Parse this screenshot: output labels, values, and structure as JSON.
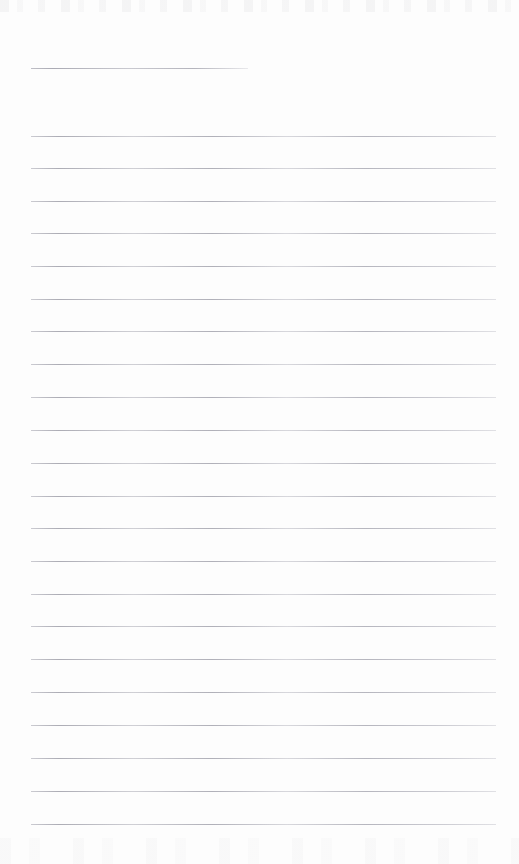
{
  "document": {
    "kind": "ruled-note-page",
    "title_text": "",
    "body_text": "",
    "page_width": 519,
    "page_height": 864,
    "background_color": "#fdfdfd",
    "rule_color": "#c8c8cc"
  },
  "layout": {
    "left_margin_x": 31,
    "right_margin_x": 496,
    "title_rule": {
      "y": 68,
      "x_start": 31,
      "x_end": 248,
      "label": "title-rule"
    },
    "body_rules": {
      "first_y": 136,
      "spacing": 32.75,
      "count": 22,
      "x_start": 31,
      "x_end": 496
    }
  },
  "rules": [
    {
      "name": "title-rule",
      "y": 68,
      "x": 31,
      "width": 217,
      "kind": "title"
    },
    {
      "name": "body-rule-1",
      "y": 136,
      "x": 31,
      "width": 465,
      "kind": "body"
    },
    {
      "name": "body-rule-2",
      "y": 168,
      "x": 31,
      "width": 465,
      "kind": "body"
    },
    {
      "name": "body-rule-3",
      "y": 201,
      "x": 31,
      "width": 465,
      "kind": "body"
    },
    {
      "name": "body-rule-4",
      "y": 233,
      "x": 31,
      "width": 465,
      "kind": "body"
    },
    {
      "name": "body-rule-5",
      "y": 266,
      "x": 31,
      "width": 465,
      "kind": "body"
    },
    {
      "name": "body-rule-6",
      "y": 299,
      "x": 31,
      "width": 465,
      "kind": "body"
    },
    {
      "name": "body-rule-7",
      "y": 331,
      "x": 31,
      "width": 465,
      "kind": "body"
    },
    {
      "name": "body-rule-8",
      "y": 364,
      "x": 31,
      "width": 465,
      "kind": "body"
    },
    {
      "name": "body-rule-9",
      "y": 397,
      "x": 31,
      "width": 465,
      "kind": "body"
    },
    {
      "name": "body-rule-10",
      "y": 430,
      "x": 31,
      "width": 465,
      "kind": "body"
    },
    {
      "name": "body-rule-11",
      "y": 463,
      "x": 31,
      "width": 465,
      "kind": "body"
    },
    {
      "name": "body-rule-12",
      "y": 496,
      "x": 31,
      "width": 465,
      "kind": "body"
    },
    {
      "name": "body-rule-13",
      "y": 528,
      "x": 31,
      "width": 465,
      "kind": "body"
    },
    {
      "name": "body-rule-14",
      "y": 561,
      "x": 31,
      "width": 465,
      "kind": "body"
    },
    {
      "name": "body-rule-15",
      "y": 594,
      "x": 31,
      "width": 465,
      "kind": "body"
    },
    {
      "name": "body-rule-16",
      "y": 626,
      "x": 31,
      "width": 465,
      "kind": "body"
    },
    {
      "name": "body-rule-17",
      "y": 659,
      "x": 31,
      "width": 465,
      "kind": "body"
    },
    {
      "name": "body-rule-18",
      "y": 692,
      "x": 31,
      "width": 465,
      "kind": "body"
    },
    {
      "name": "body-rule-19",
      "y": 725,
      "x": 31,
      "width": 465,
      "kind": "body"
    },
    {
      "name": "body-rule-20",
      "y": 758,
      "x": 31,
      "width": 465,
      "kind": "body"
    },
    {
      "name": "body-rule-21",
      "y": 791,
      "x": 31,
      "width": 465,
      "kind": "body"
    },
    {
      "name": "body-rule-22",
      "y": 824,
      "x": 31,
      "width": 465,
      "kind": "body"
    }
  ]
}
